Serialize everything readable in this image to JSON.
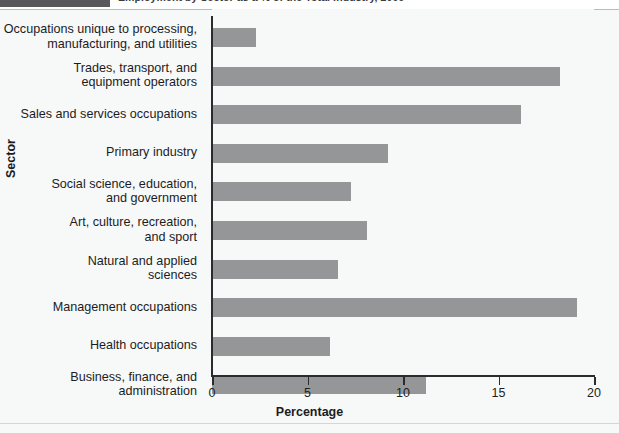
{
  "figure": {
    "title": "Employment by Sector as a % of the Total Industry, 2009",
    "bottom_note": ""
  },
  "chart_data": {
    "type": "bar",
    "orientation": "horizontal",
    "title": "Employment by Sector as a % of the Total Industry, 2009",
    "xlabel": "Percentage",
    "ylabel": "Sector",
    "xlim": [
      0,
      20
    ],
    "xticks": [
      "0",
      "5",
      "10",
      "15",
      "20"
    ],
    "xtick_values": [
      0,
      5,
      10,
      15,
      20
    ],
    "grid": false,
    "legend": "none",
    "bar_color": "#949698",
    "background_color": "#f7f8f8",
    "categories": [
      "Occupations unique to processing,\nmanufacturing, and utilities",
      "Trades, transport, and\nequipment operators",
      "Sales and services occupations",
      "Primary industry",
      "Social science, education,\nand government",
      "Art, culture, recreation,\nand sport",
      "Natural and applied\nsciences",
      "Management occupations",
      "Health occupations",
      "Business, finance, and\nadministration"
    ],
    "values": [
      2.3,
      18.2,
      16.2,
      9.2,
      7.3,
      8.1,
      6.6,
      19.1,
      6.2,
      11.2
    ]
  }
}
